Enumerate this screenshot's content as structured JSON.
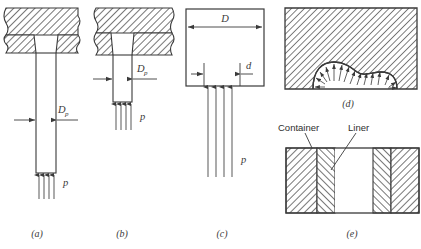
{
  "figure": {
    "background_color": "#ffffff",
    "line_color": "#3a3a3a",
    "hatch_color": "#4a4a4a",
    "panels": [
      {
        "id": "a",
        "caption": "(a)",
        "description": "Long punch in tapered die opening with pressure from below",
        "labels": [
          {
            "name": "punch-diameter",
            "base": "D",
            "sub": "p"
          },
          {
            "name": "pressure",
            "base": "p",
            "sub": ""
          }
        ],
        "arrow_count": 4
      },
      {
        "id": "b",
        "caption": "(b)",
        "description": "Short punch in tapered die opening with pressure from below",
        "labels": [
          {
            "name": "punch-diameter",
            "base": "D",
            "sub": "p"
          },
          {
            "name": "pressure",
            "base": "p",
            "sub": ""
          }
        ],
        "arrow_count": 4
      },
      {
        "id": "c",
        "caption": "(c)",
        "description": "Open rectangular container with D and d dimensions and pressure from below",
        "labels": [
          {
            "name": "outer-diameter",
            "base": "D",
            "sub": ""
          },
          {
            "name": "inner-diameter",
            "base": "d",
            "sub": ""
          },
          {
            "name": "pressure",
            "base": "p",
            "sub": ""
          }
        ],
        "arrow_count": 4
      },
      {
        "id": "d",
        "caption": "(d)",
        "description": "Hatched block with dome-shaped cavity and radial pressure arrows",
        "labels": [],
        "arrow_count": 14
      },
      {
        "id": "e",
        "caption": "(e)",
        "description": "Container with inner liner, cross-hatched in opposing directions",
        "labels": [
          {
            "name": "container-label",
            "base": "Container",
            "sub": ""
          },
          {
            "name": "liner-label",
            "base": "Liner",
            "sub": ""
          }
        ],
        "arrow_count": 0
      }
    ]
  }
}
